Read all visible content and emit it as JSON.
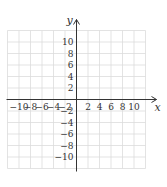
{
  "chart_data": {
    "type": "scatter",
    "title": "",
    "xlabel": "x",
    "ylabel": "y",
    "xlim": [
      -12,
      12
    ],
    "ylim": [
      -12,
      12
    ],
    "grid": true,
    "grid_step": 2,
    "x_ticks": [
      -10,
      -8,
      -6,
      -4,
      -2,
      2,
      4,
      6,
      8,
      10
    ],
    "y_ticks": [
      10,
      8,
      6,
      4,
      2,
      -2,
      -4,
      -6,
      -8,
      -10
    ],
    "series": []
  },
  "colors": {
    "grid": "#dcdcdc",
    "axis": "#333333",
    "text": "#333333"
  }
}
